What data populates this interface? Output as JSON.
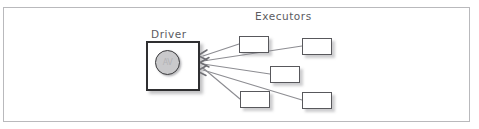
{
  "diagram": {
    "title_driver": "Driver",
    "title_executors": "Executors",
    "driver_core_text": "AV",
    "frame": {
      "x": 3,
      "y": 7,
      "width": 467,
      "height": 115,
      "border_color": "#b9b9bc"
    },
    "colors": {
      "background": "#ffffff",
      "frame_border": "#b9b9bc",
      "driver_border": "#2f2f31",
      "executor_border": "#58585c",
      "core_fill": "#c9c9cb",
      "core_border": "#3a3a3c",
      "text": "#5b5b5f",
      "arrow": "#8d8d92",
      "shadow": "rgba(130,130,135,0.45)"
    },
    "driver": {
      "label": "Driver",
      "x": 146,
      "y": 41,
      "width": 54,
      "height": 50,
      "core": {
        "cx": 166.5,
        "cy": 61.5,
        "r": 11.5
      }
    },
    "executors": [
      {
        "id": "executor-1",
        "x": 239,
        "y": 36,
        "width": 30,
        "height": 17
      },
      {
        "id": "executor-2",
        "x": 302,
        "y": 38,
        "width": 30,
        "height": 17
      },
      {
        "id": "executor-3",
        "x": 270,
        "y": 66,
        "width": 30,
        "height": 17
      },
      {
        "id": "executor-4",
        "x": 240,
        "y": 91,
        "width": 30,
        "height": 17
      },
      {
        "id": "executor-5",
        "x": 302,
        "y": 92,
        "width": 30,
        "height": 17
      }
    ],
    "connections": [
      {
        "from": "executor-1",
        "to": "driver",
        "x1": 239,
        "y1": 44,
        "x2": 203,
        "y2": 56
      },
      {
        "from": "executor-2",
        "to": "driver",
        "x1": 302,
        "y1": 46,
        "x2": 203,
        "y2": 61
      },
      {
        "from": "executor-3",
        "to": "driver",
        "x1": 270,
        "y1": 74,
        "x2": 203,
        "y2": 64
      },
      {
        "from": "executor-4",
        "to": "driver",
        "x1": 240,
        "y1": 99,
        "x2": 203,
        "y2": 68
      },
      {
        "from": "executor-5",
        "to": "driver",
        "x1": 302,
        "y1": 100,
        "x2": 203,
        "y2": 70
      }
    ],
    "arrowheads": [
      {
        "x": 199,
        "y": 55,
        "angle": 22
      },
      {
        "x": 199,
        "y": 62,
        "angle": 2
      },
      {
        "x": 199,
        "y": 71,
        "angle": -24
      }
    ]
  }
}
